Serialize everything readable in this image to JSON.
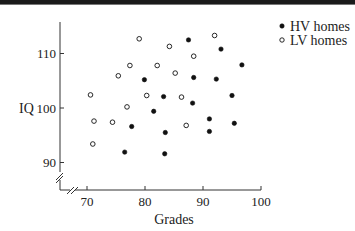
{
  "chart_data": {
    "type": "scatter",
    "title": "",
    "xlabel": "Grades",
    "ylabel": "IQ",
    "xlim": [
      66,
      100
    ],
    "ylim": [
      85,
      116
    ],
    "x_ticks": [
      70,
      80,
      90,
      100
    ],
    "y_ticks": [
      90,
      100,
      110
    ],
    "axis_breaks": true,
    "grid": false,
    "legend_position": "top-right",
    "series": [
      {
        "name": "HV homes",
        "marker": "filled-circle",
        "color": "#111111",
        "points": [
          [
            87.5,
            112.5
          ],
          [
            93.1,
            110.8
          ],
          [
            96.7,
            107.9
          ],
          [
            79.9,
            105.2
          ],
          [
            88.4,
            105.6
          ],
          [
            92.3,
            105.3
          ],
          [
            83.2,
            102.1
          ],
          [
            95.0,
            102.3
          ],
          [
            88.2,
            100.9
          ],
          [
            81.5,
            99.4
          ],
          [
            91.1,
            98.0
          ],
          [
            95.4,
            97.2
          ],
          [
            77.7,
            96.6
          ],
          [
            83.5,
            95.5
          ],
          [
            91.1,
            95.7
          ],
          [
            76.5,
            91.9
          ],
          [
            83.4,
            91.6
          ]
        ]
      },
      {
        "name": "LV homes",
        "marker": "open-circle",
        "color": "#111111",
        "points": [
          [
            79.0,
            112.7
          ],
          [
            84.2,
            111.3
          ],
          [
            92.0,
            113.3
          ],
          [
            77.4,
            107.8
          ],
          [
            82.1,
            107.8
          ],
          [
            88.4,
            109.5
          ],
          [
            75.4,
            105.9
          ],
          [
            85.2,
            106.4
          ],
          [
            70.6,
            102.4
          ],
          [
            80.3,
            102.3
          ],
          [
            86.3,
            102.0
          ],
          [
            76.9,
            100.2
          ],
          [
            71.2,
            97.6
          ],
          [
            74.4,
            97.4
          ],
          [
            87.1,
            96.8
          ],
          [
            71.0,
            93.4
          ]
        ]
      }
    ]
  },
  "axes": {
    "x_title": "Grades",
    "y_title": "IQ",
    "x_tick_labels": [
      "70",
      "80",
      "90",
      "100"
    ],
    "y_tick_labels": [
      "90",
      "100",
      "110"
    ]
  },
  "legend": {
    "items": [
      {
        "label": "HV homes",
        "marker": "filled-circle"
      },
      {
        "label": "LV homes",
        "marker": "open-circle"
      }
    ]
  }
}
